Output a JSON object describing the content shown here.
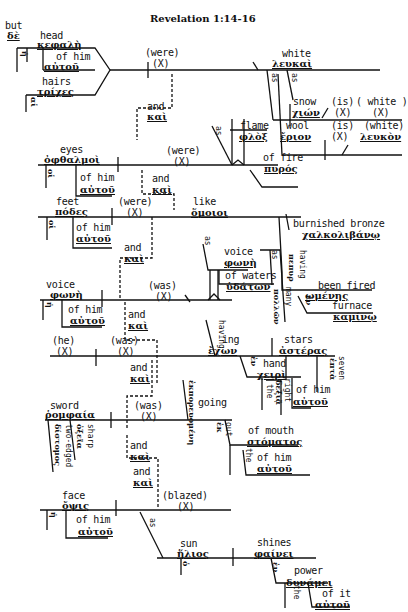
{
  "title": "Revelation 1:14-16",
  "conjunction": {
    "english": "but",
    "greek": "δὲ"
  },
  "clause1": {
    "subjects": [
      {
        "english": "head",
        "greek": "κεφαλὴ",
        "article": "ἡ",
        "article_en": "the",
        "modifier": {
          "english": "of him",
          "greek": "αὐτοῦ"
        }
      },
      {
        "english": "hairs",
        "greek": "τρίχες",
        "article": "αἱ",
        "article_en": "the"
      }
    ],
    "and": {
      "english": "and",
      "greek": "καὶ"
    },
    "verb": {
      "english": "(were)",
      "greek": "(X)"
    },
    "predicate": {
      "english": "white",
      "greek": "λευκαὶ"
    },
    "comparisons": [
      {
        "as": "as",
        "as_greek": "ὡς",
        "noun": {
          "english": "snow",
          "greek": "χιών"
        },
        "verb": {
          "english": "(is)",
          "greek": "(X)"
        },
        "pred": {
          "english": "( white )",
          "greek": "(X)"
        }
      },
      {
        "as": "as",
        "as_greek": "ὡς",
        "noun": {
          "english": "wool",
          "greek": "ἔριον"
        },
        "verb": {
          "english": "(is)",
          "greek": "(X)"
        },
        "pred": {
          "english": "(white)",
          "greek": "λευκὸν"
        }
      }
    ]
  },
  "clause2": {
    "subject": {
      "english": "eyes",
      "greek": "ὀφθαλμοὶ",
      "article": "οἱ",
      "article_en": "the",
      "modifier": {
        "english": "of him",
        "greek": "αὐτοῦ"
      }
    },
    "verb": {
      "english": "(were)",
      "greek": "(X)"
    },
    "comparison": {
      "as": "as",
      "as_greek": "ὡς",
      "noun": {
        "english": "flame",
        "greek": "φλὸξ"
      },
      "modifier": {
        "english": "of fire",
        "greek": "πυρός"
      }
    }
  },
  "clause3": {
    "subject": {
      "english": "feet",
      "greek": "πόδες",
      "article": "οἱ",
      "article_en": "the",
      "modifier": {
        "english": "of him",
        "greek": "αὐτοῦ"
      }
    },
    "verb": {
      "english": "(were)",
      "greek": "(X)"
    },
    "predicate": {
      "english": "like",
      "greek": "ὅμοιοι"
    },
    "object": {
      "english": "burnished bronze",
      "greek": "χαλκολιβάνῳ"
    },
    "participle": {
      "as": "as",
      "as_greek": "ὡς",
      "having": "having",
      "having_greek": "πεπυρ",
      "english": "been fired",
      "greek": "ωμένης",
      "prep": "in",
      "prep_greek": "ἐν",
      "noun": {
        "english": "furnace",
        "greek": "καμίνῳ"
      }
    }
  },
  "clause4": {
    "subject": {
      "english": "voice",
      "greek": "φωνὴ",
      "article": "ἡ",
      "article_en": "the",
      "modifier": {
        "english": "of him",
        "greek": "αὐτοῦ"
      }
    },
    "verb": {
      "english": "(was)",
      "greek": "(X)"
    },
    "comparison": {
      "as": "as",
      "as_greek": "ὡς",
      "noun": {
        "english": "voice",
        "greek": "φωνὴ"
      },
      "modifier": {
        "english": "of waters",
        "greek": "ὑδάτων"
      },
      "many": "many",
      "many_greek": "πολλῶν"
    }
  },
  "clause5": {
    "subject": {
      "english": "(he)",
      "greek": "(X)"
    },
    "verb": {
      "english": "(was)",
      "greek": "(X)"
    },
    "participle": {
      "english": "having",
      "greek": "ἔχων",
      "suffix": "ing"
    },
    "object": {
      "english": "stars",
      "greek": "ἀστέρας",
      "number": "seven",
      "number_greek": "ἑπτὰ"
    },
    "prep": {
      "english": "in",
      "greek": "ἐν",
      "noun": {
        "english": "hand",
        "greek": "χειρὶ"
      },
      "article": "τῇ",
      "article_en": "the",
      "adj": "right",
      "adj_greek": "δεξιᾷ",
      "modifier": {
        "english": "of him",
        "greek": "αὐτοῦ"
      }
    }
  },
  "clause6": {
    "subject": {
      "english": "sword",
      "greek": "ῥομφαία",
      "adj1": "two-edged",
      "adj1_greek": "δίστομος",
      "adj2": "sharp",
      "adj2_greek": "ὀξεῖα"
    },
    "verb": {
      "english": "(was)",
      "greek": "(X)"
    },
    "participle": {
      "english": "going",
      "greek": "ἐκπορευομένη",
      "suffix": "ing"
    },
    "prep": {
      "english": "out",
      "greek": "ἐκ",
      "noun": {
        "english": "of mouth",
        "greek": "στόματος"
      },
      "article": "τοῦ",
      "article_en": "the",
      "modifier": {
        "english": "of him",
        "greek": "αὐτοῦ"
      }
    }
  },
  "clause7": {
    "subject": {
      "english": "face",
      "greek": "ὄψις",
      "article": "ἡ",
      "article_en": "the",
      "modifier": {
        "english": "of him",
        "greek": "αὐτοῦ"
      }
    },
    "verb": {
      "english": "(blazed)",
      "greek": "(X)"
    },
    "comparison": {
      "as": "as",
      "as_greek": "ὡς",
      "noun": {
        "english": "sun",
        "greek": "ἥλιος",
        "article": "ὁ",
        "article_en": "the"
      },
      "verb": {
        "english": "shines",
        "greek": "φαίνει"
      },
      "prep": {
        "english": "in",
        "greek": "ἐν",
        "noun": {
          "english": "power",
          "greek": "δυνάμει"
        },
        "article": "τῇ",
        "article_en": "the",
        "modifier": {
          "english": "of it",
          "greek": "αὐτοῦ"
        }
      }
    }
  },
  "and_connectors": [
    {
      "english": "and",
      "greek": "καὶ"
    },
    {
      "english": "and",
      "greek": "καὶ"
    },
    {
      "english": "and",
      "greek": "καὶ"
    },
    {
      "english": "and",
      "greek": "καὶ"
    },
    {
      "english": "and",
      "greek": "καὶ"
    },
    {
      "english": "and",
      "greek": "καὶ"
    },
    {
      "english": "and",
      "greek": "καὶ"
    }
  ]
}
